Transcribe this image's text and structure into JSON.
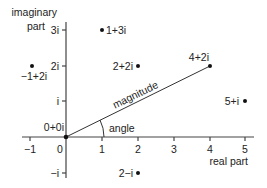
{
  "diagram": {
    "x_axis": {
      "label": "real part",
      "ticks": [
        {
          "value": -1,
          "label": "−1"
        },
        {
          "value": 0,
          "label": "0"
        },
        {
          "value": 1,
          "label": "1"
        },
        {
          "value": 2,
          "label": "2"
        },
        {
          "value": 3,
          "label": "3"
        },
        {
          "value": 4,
          "label": "4"
        },
        {
          "value": 5,
          "label": "5"
        }
      ]
    },
    "y_axis": {
      "label_line1": "imaginary",
      "label_line2": "part",
      "ticks": [
        {
          "value": 3,
          "label": "3i"
        },
        {
          "value": 2,
          "label": "2i"
        },
        {
          "value": 1,
          "label": "i"
        },
        {
          "value": -1,
          "label": "−i"
        }
      ]
    },
    "points": [
      {
        "re": 1,
        "im": 3,
        "label": "1+3i"
      },
      {
        "re": -1,
        "im": 2,
        "label": "−1+2i"
      },
      {
        "re": 2,
        "im": 2,
        "label": "2+2i"
      },
      {
        "re": 4,
        "im": 2,
        "label": "4+2i"
      },
      {
        "re": 5,
        "im": 1,
        "label": "5+i"
      },
      {
        "re": 0,
        "im": 0,
        "label": "0+0i"
      },
      {
        "re": 2,
        "im": -1,
        "label": "2−i"
      }
    ],
    "vector": {
      "from": "0+0i",
      "to": "4+2i",
      "label": "magnitude"
    },
    "angle_label": "angle"
  }
}
